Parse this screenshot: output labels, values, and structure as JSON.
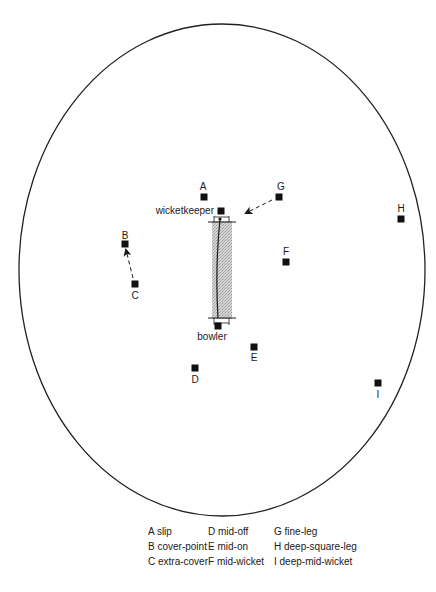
{
  "diagram": {
    "boundary": {
      "cx": 222,
      "cy": 270,
      "rx": 203,
      "ry": 246,
      "stroke": "#222222"
    },
    "pitch": {
      "x": 212,
      "y": 221,
      "width": 20,
      "height": 98,
      "fill": "#c8c8c8"
    },
    "players": [
      {
        "id": "A",
        "label": "A",
        "x": 204,
        "y": 197,
        "label_x": 203,
        "label_y": 190,
        "label_anchor": "middle"
      },
      {
        "id": "keeper",
        "label": "wicketkeeper",
        "x": 221,
        "y": 211,
        "label_x": 214,
        "label_y": 214,
        "label_anchor": "end"
      },
      {
        "id": "G",
        "label": "G",
        "x": 279,
        "y": 197,
        "label_x": 281,
        "label_y": 190,
        "label_anchor": "middle"
      },
      {
        "id": "B",
        "label": "B",
        "x": 125,
        "y": 244,
        "label_x": 125,
        "label_y": 239,
        "label_anchor": "middle"
      },
      {
        "id": "C",
        "label": "C",
        "x": 135,
        "y": 284,
        "label_x": 135,
        "label_y": 299,
        "label_anchor": "middle"
      },
      {
        "id": "F",
        "label": "F",
        "x": 286,
        "y": 262,
        "label_x": 286,
        "label_y": 255,
        "label_anchor": "middle"
      },
      {
        "id": "H",
        "label": "H",
        "x": 401,
        "y": 219,
        "label_x": 401,
        "label_y": 212,
        "label_anchor": "middle"
      },
      {
        "id": "bowler",
        "label": "bowler",
        "x": 218,
        "y": 326,
        "label_x": 212,
        "label_y": 340,
        "label_anchor": "middle"
      },
      {
        "id": "E",
        "label": "E",
        "x": 254,
        "y": 347,
        "label_x": 254,
        "label_y": 361,
        "label_anchor": "middle"
      },
      {
        "id": "D",
        "label": "D",
        "x": 195,
        "y": 368,
        "label_x": 195,
        "label_y": 383,
        "label_anchor": "middle"
      },
      {
        "id": "I",
        "label": "I",
        "x": 378,
        "y": 383,
        "label_x": 378,
        "label_y": 398,
        "label_anchor": "middle"
      }
    ],
    "arrows": [
      {
        "name": "arrow-g-to-keeper",
        "x1": 272,
        "y1": 200,
        "x2": 246,
        "y2": 213,
        "style": "dashed"
      },
      {
        "name": "arrow-c-to-b",
        "x1": 133,
        "y1": 278,
        "x2": 126,
        "y2": 250,
        "style": "dashed"
      }
    ]
  },
  "legend": {
    "items": [
      "A slip",
      "D mid-off",
      "G fine-leg",
      "B cover-point",
      "E mid-on",
      "H deep-square-leg",
      "C extra-cover",
      "F mid-wicket",
      "I deep-mid-wicket"
    ]
  }
}
